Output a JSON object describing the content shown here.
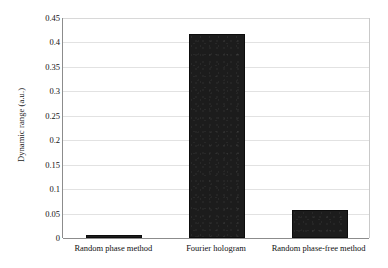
{
  "chart_data": {
    "type": "bar",
    "title": "",
    "xlabel": "",
    "ylabel": "Dynamic range (a.u.)",
    "categories": [
      "Random phase method",
      "Fourier hologram",
      "Random phase-free method"
    ],
    "values": [
      0.005,
      0.418,
      0.057
    ],
    "ylim": [
      0,
      0.45
    ],
    "ytick_labels": [
      "0",
      "0.05",
      "0.1",
      "0.15",
      "0.2",
      "0.25",
      "0.3",
      "0.35",
      "0.4",
      "0.45"
    ],
    "ytick_values": [
      0,
      0.05,
      0.1,
      0.15,
      0.2,
      0.25,
      0.3,
      0.35,
      0.4,
      0.45
    ],
    "grid": true,
    "legend": false,
    "legend_position": "none",
    "series": [
      {
        "name": "Dynamic range",
        "color": "#1c1c1c",
        "values": [
          0.005,
          0.418,
          0.057
        ]
      }
    ],
    "colors": {
      "bar": "#1c1c1c",
      "gridline": "#e2e2e2",
      "axis": "#8c8c8c",
      "text": "#111111",
      "background": "#ffffff"
    }
  }
}
